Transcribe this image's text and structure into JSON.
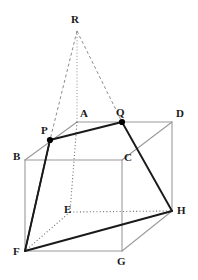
{
  "figure": {
    "kind": "solid-geometry-diagram",
    "canvas": {
      "width": 198,
      "height": 280
    },
    "background_color": "#ffffff",
    "colors": {
      "cube_edge": "#9a9a9a",
      "section_line": "#1a1a1a",
      "hidden_line": "#6b6b6b",
      "apex_line": "#8c8c8c",
      "point_fill": "#000000",
      "label_text": "#1a1a1a"
    },
    "points": [
      {
        "name": "R",
        "label": "R",
        "x": 77,
        "y": 31,
        "label_x": 71,
        "label_y": 14,
        "marked": false,
        "role": "apex"
      },
      {
        "name": "A",
        "label": "A",
        "x": 77,
        "y": 122,
        "label_x": 80,
        "label_y": 108,
        "marked": false,
        "role": "cube-vertex"
      },
      {
        "name": "Q",
        "label": "Q",
        "x": 122,
        "y": 122,
        "label_x": 116,
        "label_y": 107,
        "marked": true,
        "role": "section-point"
      },
      {
        "name": "D",
        "label": "D",
        "x": 172,
        "y": 122,
        "label_x": 176,
        "label_y": 108,
        "marked": false,
        "role": "cube-vertex"
      },
      {
        "name": "P",
        "label": "P",
        "x": 50,
        "y": 140,
        "label_x": 41,
        "label_y": 125,
        "marked": true,
        "role": "section-point"
      },
      {
        "name": "B",
        "label": "B",
        "x": 25,
        "y": 160,
        "label_x": 13,
        "label_y": 151,
        "marked": false,
        "role": "cube-vertex"
      },
      {
        "name": "C",
        "label": "C",
        "x": 122,
        "y": 160,
        "label_x": 124,
        "label_y": 152,
        "marked": false,
        "role": "cube-vertex"
      },
      {
        "name": "E",
        "label": "E",
        "x": 70,
        "y": 212,
        "label_x": 64,
        "label_y": 204,
        "marked": false,
        "role": "cube-vertex"
      },
      {
        "name": "H",
        "label": "H",
        "x": 172,
        "y": 211,
        "label_x": 177,
        "label_y": 205,
        "marked": false,
        "role": "cube-vertex"
      },
      {
        "name": "F",
        "label": "F",
        "x": 25,
        "y": 251,
        "label_x": 13,
        "label_y": 246,
        "marked": false,
        "role": "cube-vertex"
      },
      {
        "name": "G",
        "label": "G",
        "x": 122,
        "y": 251,
        "label_x": 117,
        "label_y": 256,
        "marked": false,
        "role": "cube-vertex"
      }
    ],
    "edges_cube_visible": [
      {
        "from": "A",
        "to": "D",
        "style": "solid",
        "weight": 1.1
      },
      {
        "from": "A",
        "to": "B",
        "style": "solid",
        "weight": 1.1
      },
      {
        "from": "B",
        "to": "C",
        "style": "solid",
        "weight": 1.1
      },
      {
        "from": "C",
        "to": "D",
        "style": "solid",
        "weight": 1.1
      },
      {
        "from": "B",
        "to": "F",
        "style": "solid",
        "weight": 1.1
      },
      {
        "from": "C",
        "to": "G",
        "style": "solid",
        "weight": 1.1
      },
      {
        "from": "D",
        "to": "H",
        "style": "solid",
        "weight": 1.1
      },
      {
        "from": "F",
        "to": "G",
        "style": "solid",
        "weight": 1.1
      },
      {
        "from": "G",
        "to": "H",
        "style": "solid",
        "weight": 1.1
      }
    ],
    "edges_cube_hidden": [
      {
        "from": "A",
        "to": "E",
        "style": "dotted",
        "weight": 1.1
      },
      {
        "from": "E",
        "to": "F",
        "style": "dotted",
        "weight": 1.1
      },
      {
        "from": "E",
        "to": "H",
        "style": "dotted",
        "weight": 1.1
      }
    ],
    "section_lines": [
      {
        "from": "P",
        "to": "Q",
        "style": "solid",
        "weight": 1.9
      },
      {
        "from": "Q",
        "to": "H",
        "style": "solid",
        "weight": 1.9
      },
      {
        "from": "H",
        "to": "F",
        "style": "solid",
        "weight": 1.9
      },
      {
        "from": "F",
        "to": "P",
        "style": "solid",
        "weight": 1.9
      }
    ],
    "apex_lines": [
      {
        "from": "R",
        "to": "P",
        "style": "dashed",
        "weight": 1.0
      },
      {
        "from": "R",
        "to": "A",
        "style": "dotted",
        "weight": 1.0
      },
      {
        "from": "R",
        "to": "Q",
        "style": "dashed",
        "weight": 1.0
      }
    ],
    "extension_lines": [
      {
        "from": "P",
        "to": "F",
        "style": "solid",
        "weight": 1.4,
        "note": "edge BA extended meets plane"
      }
    ]
  }
}
